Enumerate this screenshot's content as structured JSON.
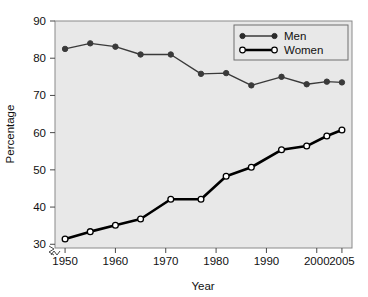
{
  "chart_data": {
    "type": "line",
    "title": "",
    "subtitle": "",
    "xlabel": "Year",
    "ylabel": "Percentage",
    "xlim": [
      1948,
      2007
    ],
    "ylim": [
      29,
      90
    ],
    "xticks": [
      1950,
      1960,
      1970,
      1980,
      1990,
      2000,
      2005
    ],
    "xticklabels": [
      "1950",
      "1960",
      "1970",
      "1980",
      "1990",
      "2000",
      "2005"
    ],
    "yticks": [
      30,
      40,
      50,
      60,
      70,
      80,
      90
    ],
    "yticklabels": [
      "30",
      "40",
      "50",
      "60",
      "70",
      "80",
      "90"
    ],
    "grid": false,
    "axis_break": true,
    "legend_position": "top-right",
    "plot_background": "#e8e8e8",
    "figure_background": "#ffffff",
    "series": [
      {
        "name": "Men",
        "marker": "filled-circle",
        "color": "#3a3a3a",
        "line_width": 1.4,
        "x": [
          1950,
          1955,
          1960,
          1965,
          1971,
          1977,
          1982,
          1987,
          1993,
          1998,
          2002,
          2005
        ],
        "values": [
          82.5,
          84.0,
          83.1,
          81.0,
          81.0,
          75.8,
          76.0,
          72.7,
          75.0,
          73.0,
          73.7,
          73.5
        ]
      },
      {
        "name": "Women",
        "marker": "open-circle",
        "color": "#000000",
        "line_width": 2.6,
        "x": [
          1950,
          1955,
          1960,
          1965,
          1971,
          1977,
          1982,
          1987,
          1993,
          1998,
          2002,
          2005
        ],
        "values": [
          31.4,
          33.4,
          35.1,
          36.8,
          42.1,
          42.1,
          48.3,
          50.7,
          55.4,
          56.4,
          59.1,
          60.7
        ]
      }
    ]
  },
  "legend": {
    "entries": [
      {
        "label": "Men"
      },
      {
        "label": "Women"
      }
    ]
  },
  "axes": {
    "x_title": "Year",
    "y_title": "Percentage"
  }
}
